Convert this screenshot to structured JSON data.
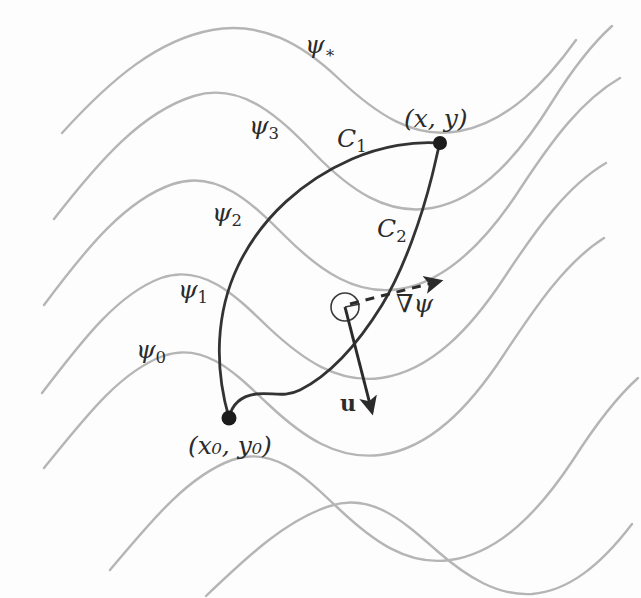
{
  "figure": {
    "background_color": "#fdfdfd",
    "contour_color": "#b5b5b5",
    "path_color": "#333333",
    "label_color": "#2b2b2b",
    "width": 641,
    "height": 598
  },
  "level_curves": [
    {
      "id": "psi0",
      "label_psi": "ψ",
      "label_sub": "0",
      "label_x": 136,
      "label_y": 337
    },
    {
      "id": "psi1",
      "label_psi": "ψ",
      "label_sub": "1",
      "label_x": 178,
      "label_y": 277
    },
    {
      "id": "psi2",
      "label_psi": "ψ",
      "label_sub": "2",
      "label_x": 212,
      "label_y": 200
    },
    {
      "id": "psi3",
      "label_psi": "ψ",
      "label_sub": "3",
      "label_x": 249,
      "label_y": 113
    },
    {
      "id": "psistar",
      "label_psi": "ψ",
      "label_sub": "∗",
      "label_x": 305,
      "label_y": 32
    }
  ],
  "paths": [
    {
      "id": "C1",
      "label_c": "C",
      "label_sub": "1",
      "label_x": 337,
      "label_y": 126
    },
    {
      "id": "C2",
      "label_c": "C",
      "label_sub": "2",
      "label_x": 377,
      "label_y": 216
    }
  ],
  "points": [
    {
      "id": "end-point",
      "label": "(x, y)",
      "label_x": 404,
      "label_y": 106,
      "dot_x": 440,
      "dot_y": 143
    },
    {
      "id": "start-point",
      "label": "(x₀, y₀)",
      "label_x": 188,
      "label_y": 433,
      "dot_x": 229,
      "dot_y": 418
    }
  ],
  "vectors": [
    {
      "id": "gradient",
      "label": "∇ψ",
      "label_x": 396,
      "label_y": 291,
      "style": "dashed"
    },
    {
      "id": "velocity",
      "label": "u",
      "label_x": 340,
      "label_y": 392,
      "style": "solid"
    }
  ],
  "markers": [
    {
      "id": "right-angle-circle",
      "cx": 345,
      "cy": 307,
      "r": 14
    }
  ]
}
